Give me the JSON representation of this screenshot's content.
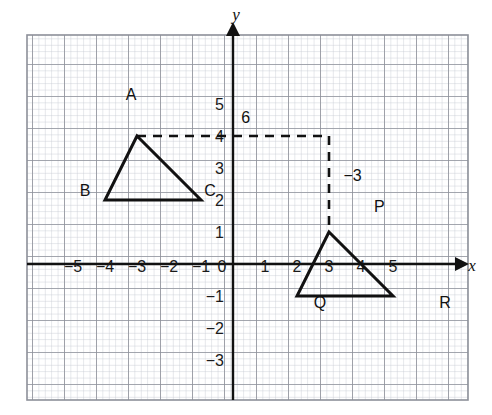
{
  "figure": {
    "axis_labels": {
      "x": "x",
      "y": "y"
    },
    "x_ticks": [
      "-5",
      "-4",
      "-3",
      "-2",
      "-1",
      "0",
      "1",
      "2",
      "3",
      "4",
      "5"
    ],
    "y_ticks": [
      "5",
      "4",
      "3",
      "2",
      "1",
      "0",
      "-1",
      "-2",
      "-3"
    ],
    "colors": {
      "minor_grid": "#c9ccd4",
      "major_grid": "#8d9099",
      "axis": "#111111",
      "shape_stroke": "#111111",
      "dashed_stroke": "#111111",
      "background": "#ffffff"
    }
  },
  "chart_data": {
    "type": "scatter",
    "xlabel": "x",
    "ylabel": "y",
    "xlim": [
      -5.7,
      5.9
    ],
    "ylim": [
      -3.7,
      5.8
    ],
    "grid": true,
    "minor_grid_step": 0.2,
    "major_grid_step": 1,
    "legend": "none",
    "shapes": [
      {
        "name": "triangle-abc",
        "kind": "polygon",
        "closed": true,
        "style": "solid",
        "points": [
          {
            "label": "A",
            "x": -3,
            "y": 4,
            "label_pos": "above"
          },
          {
            "label": "B",
            "x": -4,
            "y": 2,
            "label_pos": "below-left"
          },
          {
            "label": "C",
            "x": -1,
            "y": 2,
            "label_pos": "below-right"
          }
        ]
      },
      {
        "name": "triangle-pqr",
        "kind": "polygon",
        "closed": true,
        "style": "solid",
        "points": [
          {
            "label": "P",
            "x": 3,
            "y": 1,
            "label_pos": "above-right"
          },
          {
            "label": "Q",
            "x": 2,
            "y": -1,
            "label_pos": "below-left"
          },
          {
            "label": "R",
            "x": 5,
            "y": -1,
            "label_pos": "below-right"
          }
        ]
      }
    ],
    "annotations": [
      {
        "name": "horizontal-translation",
        "kind": "dashed-segment",
        "from": {
          "x": -3,
          "y": 4
        },
        "to": {
          "x": 3,
          "y": 4
        },
        "label": "6",
        "label_x": 0.4,
        "label_y": 4.4
      },
      {
        "name": "vertical-translation",
        "kind": "dashed-segment",
        "from": {
          "x": 3,
          "y": 4
        },
        "to": {
          "x": 3,
          "y": 1
        },
        "label": "−3",
        "label_x": 3.45,
        "label_y": 2.6
      }
    ]
  }
}
